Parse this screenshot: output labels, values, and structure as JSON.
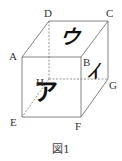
{
  "figure": {
    "caption": "図1",
    "vertices": {
      "A": "A",
      "B": "B",
      "C": "C",
      "D": "D",
      "E": "E",
      "F": "F",
      "G": "G",
      "H": "H"
    },
    "faces": {
      "top": "ウ",
      "front": "ア",
      "right": "イ"
    },
    "colors": {
      "line": "#555555",
      "text": "#222222"
    }
  }
}
